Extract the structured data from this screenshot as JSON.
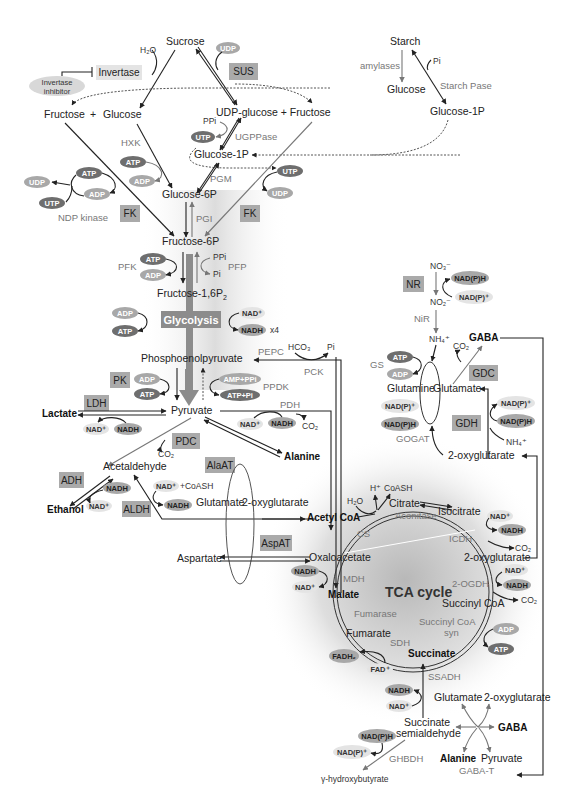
{
  "colors": {
    "enzyme_box": "#aaaaaa",
    "pill_dark": "#6e6e6e",
    "pill_medium": "#a8a8a8",
    "pill_light": "#e4e4e4",
    "glycolysis_bar": "#8c8c8c",
    "enzyme_text": "#777777",
    "line": "#222222"
  },
  "sucrose_section": {
    "sucrose": "Sucrose",
    "h2o": "H₂O",
    "invertase": "Invertase",
    "invertase_inhibitor_line1": "Invertase",
    "invertase_inhibitor_line2": "inhibitor",
    "sus": "SUS",
    "udp": "UDP",
    "fructose": "Fructose",
    "plus": "+",
    "glucose": "Glucose",
    "udp_glucose_plus_fructose": "UDP-glucose + Fructose",
    "ppi": "PPi",
    "utp": "UTP",
    "ugppase": "UGPPase",
    "glucose_1p": "Glucose-1P",
    "pgm": "PGM",
    "hxk": "HXK",
    "atp": "ATP",
    "adp": "ADP",
    "glucose_6p": "Glucose-6P",
    "fk_left": "FK",
    "fk_right": "FK",
    "ndp_kinase": "NDP kinase",
    "ndp_pills": {
      "atp": "ATP",
      "udp": "UDP",
      "adp": "ADP",
      "utp": "UTP"
    },
    "fk_right_utp": "UTP",
    "fk_right_udp": "UDP"
  },
  "starch_section": {
    "starch": "Starch",
    "amylases": "amylases",
    "pi": "Pi",
    "starch_pase": "Starch Pase",
    "glucose": "Glucose",
    "glucose_1p": "Glucose-1P"
  },
  "glycolysis": {
    "pgi": "PGI",
    "fructose_6p": "Fructose-6P",
    "pfk": "PFK",
    "pfk_atp": "ATP",
    "pfk_adp": "ADP",
    "ppi": "PPi",
    "pi": "Pi",
    "pfp": "PFP",
    "fructose_16p2": "Fructose-1,6P",
    "fructose_16p2_sub": "2",
    "glycolysis_label": "Glycolysis",
    "adp": "ADP",
    "atp": "ATP",
    "nad_plus": "NAD⁺",
    "nadh": "NADH",
    "x4": "x4",
    "pep": "Phosphoenolpyruvate",
    "pepc": "PEPC",
    "hco3": "HCO₃",
    "pi_pepc": "Pi",
    "pck": "PCK",
    "pk": "PK",
    "pk_adp": "ADP",
    "pk_atp": "ATP",
    "ppdk_in": "AMP+PPi",
    "ppdk_out": "ATP+Pi",
    "ppdk": "PPDK",
    "pyruvate": "Pyruvate",
    "pdh": "PDH",
    "pdh_nad": "NAD⁺",
    "pdh_nadh": "NADH",
    "pdh_co2": "CO₂"
  },
  "fermentation": {
    "ldh": "LDH",
    "lactate": "Lactate",
    "ldh_nad": "NAD⁺",
    "ldh_nadh": "NADH",
    "pdc": "PDC",
    "co2": "CO₂",
    "acetaldehyde": "Acetaldehyde",
    "adh": "ADH",
    "adh_nadh": "NADH",
    "adh_nad": "NAD⁺",
    "ethanol": "Ethanol",
    "aldh": "ALDH",
    "aldh_in": "NAD⁺ +CoASH",
    "aldh_nadh": "NADH",
    "alanine": "Alanine",
    "alaat": "AlaAT",
    "glutamate": "Glutamate",
    "oxyglutarate": "2-oxyglutarate",
    "aspat": "AspAT",
    "aspartate": "Aspartate"
  },
  "nitrogen": {
    "no3": "NO₃⁻",
    "nr": "NR",
    "nadph": "NAD(P)H",
    "nadp_plus": "NAD(P)⁺",
    "no2": "NO₂⁻",
    "nir": "NiR",
    "nh4": "NH₄⁺",
    "gaba": "GABA",
    "co2": "CO₂",
    "gs": "GS",
    "gs_atp": "ATP",
    "gs_adp": "ADP",
    "gdc": "GDC",
    "glutamine": "Glutamine",
    "glutamate": "Glutamate",
    "gogat_nadp": "NAD(P)⁺",
    "gogat_nadph": "NAD(P)H",
    "gogat": "GOGAT",
    "gdh": "GDH",
    "gdh_nadp": "NAD(P)⁺",
    "gdh_nadph": "NAD(P)H",
    "gdh_nh4": "NH₄⁺",
    "oxyglutarate": "2-oxyglutarate"
  },
  "tca": {
    "label": "TCA cycle",
    "h2o": "H₂O",
    "h_plus": "H⁺",
    "coash": "CoASH",
    "citrate": "Citrate",
    "acetyl_coa": "Acetyl CoA",
    "aconitase": "Aconitase",
    "isocitrate": "Isocitrate",
    "cs": "CS",
    "icdh_nad": "NAD⁺",
    "icdh_nadh": "NADH",
    "icdh": "ICDH",
    "icdh_co2": "CO₂",
    "oxaloacetate": "Oxaloacetate",
    "oxyglutarate": "2-oxyglutarate",
    "mdh_nadh": "NADH",
    "mdh_nad": "NAD⁺",
    "mdh": "MDH",
    "ogdh": "2-OGDH",
    "ogdh_nad": "NAD⁺",
    "ogdh_nadh": "NADH",
    "ogdh_co2": "CO₂",
    "malate": "Malate",
    "succinyl_coa": "Succinyl CoA",
    "fumarase": "Fumarase",
    "scs_line1": "Succinyl CoA",
    "scs_line2": "syn",
    "scs_adp": "ADP",
    "scs_atp": "ATP",
    "fumarate": "Fumarate",
    "sdh": "SDH",
    "succinate": "Succinate",
    "fadh2": "FADH₂",
    "fad": "FAD⁺"
  },
  "gaba_shunt": {
    "ssadh": "SSADH",
    "nadh": "NADH",
    "nad_plus": "NAD⁺",
    "glutamate": "Glutamate",
    "oxyglutarate": "2-oxyglutarate",
    "ssa_line1": "Succinate",
    "ssa_line2": "semialdehyde",
    "gaba": "GABA",
    "nadph": "NAD(P)H",
    "nadp_plus": "NAD(P)⁺",
    "ghbdh": "GHBDH",
    "alanine": "Alanine",
    "pyruvate": "Pyruvate",
    "gaba_t": "GABA-T",
    "ghb": "γ-hydroxybutyrate"
  }
}
